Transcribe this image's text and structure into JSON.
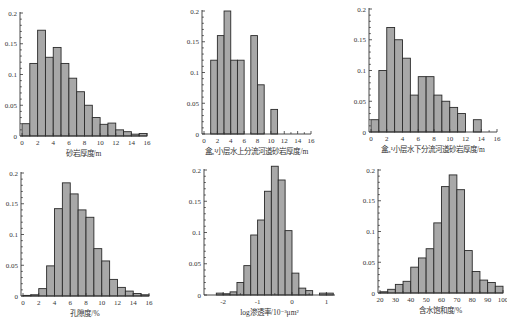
{
  "figure": {
    "panels": [
      {
        "id": "p1",
        "left": 0,
        "top": 0,
        "width": 169,
        "height": 160
      },
      {
        "id": "p2",
        "left": 169,
        "top": 0,
        "width": 169,
        "height": 160
      },
      {
        "id": "p3",
        "left": 338,
        "top": 0,
        "width": 169,
        "height": 160
      },
      {
        "id": "p4",
        "left": 0,
        "top": 160,
        "width": 169,
        "height": 160
      },
      {
        "id": "p5",
        "left": 169,
        "top": 160,
        "width": 169,
        "height": 160
      },
      {
        "id": "p6",
        "left": 338,
        "top": 160,
        "width": 169,
        "height": 160
      }
    ]
  },
  "chart_data": [
    {
      "type": "bar",
      "title": "",
      "xlabel": "砂岩厚度/m",
      "ylabel": "",
      "xlim": [
        0,
        16
      ],
      "ylim": [
        0,
        0.2
      ],
      "xticks": [
        0,
        2,
        4,
        6,
        8,
        10,
        12,
        14,
        16
      ],
      "yticks": [
        0,
        0.05,
        0.1,
        0.15,
        0.2
      ],
      "ytick_labels": [
        "0",
        "0.05",
        "0.1",
        "0.15",
        "0.2"
      ],
      "bin_width": 1,
      "bin_starts": [
        0,
        1,
        2,
        3,
        4,
        5,
        6,
        7,
        8,
        9,
        10,
        11,
        12,
        13,
        14,
        15
      ],
      "values": [
        0.02,
        0.118,
        0.172,
        0.128,
        0.144,
        0.118,
        0.094,
        0.072,
        0.05,
        0.03,
        0.019,
        0.021,
        0.01,
        0.007,
        0.003,
        0.004
      ],
      "grid": false,
      "frame": {
        "x0": 22,
        "x1": 147,
        "y0": 136,
        "y1": 13,
        "axis_x": 20
      }
    },
    {
      "type": "bar",
      "title": "",
      "xlabel": "盒₈¹小层水上分流河道砂岩厚度/m",
      "ylabel": "",
      "xlim": [
        0,
        16
      ],
      "ylim": [
        0,
        0.2
      ],
      "xticks": [
        0,
        2,
        4,
        6,
        8,
        10,
        12,
        14,
        16
      ],
      "yticks": [
        0,
        0.05,
        0.1,
        0.15,
        0.2
      ],
      "ytick_labels": [
        "0",
        "0.05",
        "0.1",
        "0.15",
        "0.2"
      ],
      "bin_width": 1,
      "bin_starts": [
        0,
        1,
        2,
        3,
        4,
        5,
        6,
        7,
        8,
        9,
        10,
        11,
        12,
        13,
        14,
        15
      ],
      "values": [
        0,
        0.12,
        0.16,
        0.2,
        0.12,
        0.12,
        0,
        0.16,
        0.08,
        0,
        0.04,
        0,
        0,
        0,
        0,
        0
      ],
      "grid": false,
      "frame": {
        "x0": 35,
        "x1": 142,
        "y0": 134,
        "y1": 11,
        "axis_x": 33
      }
    },
    {
      "type": "bar",
      "title": "",
      "xlabel": "盒₈¹小层水下分流河道砂岩厚度/m",
      "ylabel": "",
      "xlim": [
        0,
        16
      ],
      "ylim": [
        0,
        0.2
      ],
      "xticks": [
        0,
        2,
        4,
        6,
        8,
        10,
        12,
        14,
        16
      ],
      "yticks": [
        0,
        0.05,
        0.1,
        0.15,
        0.2
      ],
      "ytick_labels": [
        "0",
        "0.05",
        "0.1",
        "0.15",
        "0.2"
      ],
      "bin_width": 1,
      "bin_starts": [
        0,
        1,
        2,
        3,
        4,
        5,
        6,
        7,
        8,
        9,
        10,
        11,
        12,
        13,
        14,
        15
      ],
      "values": [
        0.02,
        0.1,
        0.17,
        0.15,
        0.12,
        0.06,
        0.09,
        0.09,
        0.06,
        0.05,
        0.04,
        0.03,
        0,
        0.02,
        0,
        0
      ],
      "grid": false,
      "frame": {
        "x0": 33,
        "x1": 159,
        "y0": 132,
        "y1": 9,
        "axis_x": 31
      }
    },
    {
      "type": "bar",
      "title": "",
      "xlabel": "孔隙度/%",
      "ylabel": "",
      "xlim": [
        0,
        16
      ],
      "ylim": [
        0,
        0.2
      ],
      "xticks": [
        0,
        2,
        4,
        6,
        8,
        10,
        12,
        14,
        16
      ],
      "yticks": [
        0,
        0.05,
        0.1,
        0.15,
        0.2
      ],
      "ytick_labels": [
        "0",
        "0.05",
        "0.1",
        "0.15",
        "0.2"
      ],
      "bin_width": 1,
      "bin_starts": [
        0,
        1,
        2,
        3,
        4,
        5,
        6,
        7,
        8,
        9,
        10,
        11,
        12,
        13,
        14,
        15
      ],
      "values": [
        0.001,
        0.002,
        0.012,
        0.049,
        0.142,
        0.184,
        0.166,
        0.14,
        0.128,
        0.077,
        0.057,
        0.027,
        0.014,
        0.008,
        0.004,
        0.002
      ],
      "grid": false,
      "frame": {
        "x0": 23,
        "x1": 149,
        "y0": 136,
        "y1": 13,
        "axis_x": 21
      }
    },
    {
      "type": "bar",
      "title": "",
      "xlabel": "log渗透率/10⁻³μm²",
      "ylabel": "",
      "xlim": [
        -2.5,
        1.25
      ],
      "ylim": [
        0,
        0.2
      ],
      "xticks": [
        -2,
        -1,
        0,
        1
      ],
      "yticks": [
        0,
        0.05,
        0.1,
        0.15,
        0.2
      ],
      "ytick_labels": [
        "0",
        "0.05",
        "0.1",
        "0.15",
        "0.2"
      ],
      "bin_width": 0.2,
      "bin_starts": [
        -2.2,
        -2.0,
        -1.8,
        -1.6,
        -1.4,
        -1.2,
        -1.0,
        -0.8,
        -0.6,
        -0.4,
        -0.2,
        0.0,
        0.2,
        0.4,
        0.6,
        0.8,
        1.0
      ],
      "values": [
        0.003,
        0.002,
        0.005,
        0.02,
        0.047,
        0.096,
        0.12,
        0.166,
        0.206,
        0.184,
        0.103,
        0.035,
        0.011,
        0.007,
        0,
        0.003,
        0.003
      ],
      "grid": false,
      "frame": {
        "x0": 37,
        "x1": 166,
        "y0": 135,
        "y1": 10,
        "axis_x": 35
      }
    },
    {
      "type": "bar",
      "title": "",
      "xlabel": "含水饱和度/%",
      "ylabel": "",
      "xlim": [
        20,
        100
      ],
      "ylim": [
        0,
        0.2
      ],
      "xticks": [
        20,
        30,
        40,
        50,
        60,
        70,
        80,
        90,
        100
      ],
      "yticks": [
        0,
        0.05,
        0.1,
        0.15,
        0.2
      ],
      "ytick_labels": [
        "0",
        "0.05",
        "0.1",
        "0.15",
        "0.2"
      ],
      "bin_width": 5,
      "bin_starts": [
        20,
        25,
        30,
        35,
        40,
        45,
        50,
        55,
        60,
        65,
        70,
        75,
        80,
        85,
        90,
        95
      ],
      "values": [
        0.002,
        0.006,
        0.014,
        0.019,
        0.042,
        0.057,
        0.072,
        0.114,
        0.173,
        0.192,
        0.168,
        0.069,
        0.035,
        0.021,
        0.017,
        0.011
      ],
      "grid": false,
      "frame": {
        "x0": 42,
        "x1": 165,
        "y0": 133,
        "y1": 10,
        "axis_x": 40
      }
    }
  ]
}
